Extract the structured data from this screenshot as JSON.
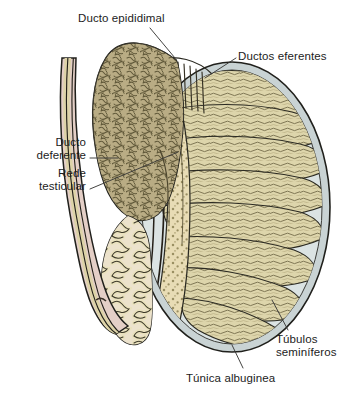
{
  "figure": {
    "width": 339,
    "height": 398,
    "background_color": "#ffffff"
  },
  "labels": [
    {
      "id": "ducto-epididimal",
      "text": "Ducto epididimal",
      "anchor": "left",
      "x": 78,
      "y": 12,
      "leader_from": [
        150,
        28
      ],
      "leader_to": [
        175,
        58
      ]
    },
    {
      "id": "ductos-eferentes",
      "text": "Ductos eferentes",
      "anchor": "left",
      "x": 238,
      "y": 50,
      "leader_from": [
        236,
        58
      ],
      "leader_to": [
        205,
        78
      ]
    },
    {
      "id": "ducto-deferente",
      "text": "Ducto\ndeferente",
      "anchor": "right",
      "x": 0,
      "y": 136,
      "leader_from": [
        90,
        158
      ],
      "leader_to": [
        118,
        158
      ]
    },
    {
      "id": "rede-testicular",
      "text": "Rede\ntesticular",
      "anchor": "right",
      "x": 0,
      "y": 167,
      "leader_from": [
        90,
        189
      ],
      "leader_to": [
        178,
        152
      ]
    },
    {
      "id": "tubulos-seminiferos",
      "text": "Túbulos\nseminíferos",
      "anchor": "left",
      "x": 276,
      "y": 333,
      "leader_from": [
        288,
        330
      ],
      "leader_to": [
        272,
        300
      ]
    },
    {
      "id": "tunica-albuginea",
      "text": "Túnica albuginea",
      "anchor": "left",
      "x": 186,
      "y": 372,
      "leader_from": [
        243,
        368
      ],
      "leader_to": [
        232,
        345
      ]
    }
  ],
  "colors": {
    "outline": "#20201c",
    "leader_line": "#3a3a38",
    "text": "#1c1c1c",
    "tunica_albuginea": "#c9d3d4",
    "tunica_albuginea_inner": "#dbe3e3",
    "seminiferous_lobule": "#ddd5ab",
    "seminiferous_strand": "#6e6644",
    "mediastinum_rete": "#e8dcb5",
    "rete_stipple": "#8a8057",
    "epididymis_body": "#b5a880",
    "epididymal_tubule": "#6a6143",
    "epididymis_sheath": "#e3d6cc",
    "ductus_deferens_wall": "#e4cfc7",
    "ductus_deferens_lumen": "#ddd3a8",
    "efferent_ductule": "#4d4734",
    "page_background": "#ffffff"
  },
  "structures": [
    {
      "id": "testis-oval",
      "name": "testis-body",
      "label_ref": "tunica-albuginea"
    },
    {
      "id": "tunica-albuginea",
      "name": "tunica-albuginea-capsule",
      "label_ref": "tunica-albuginea"
    },
    {
      "id": "seminiferous-lobules",
      "name": "seminiferous-tubule-lobules",
      "label_ref": "tubulos-seminiferos"
    },
    {
      "id": "mediastinum",
      "name": "rete-testis-mediastinum",
      "label_ref": "rede-testicular"
    },
    {
      "id": "efferent-ductules",
      "name": "efferent-ductules",
      "label_ref": "ductos-eferentes"
    },
    {
      "id": "epididymis-head",
      "name": "epididymal-duct-mass",
      "label_ref": "ducto-epididimal"
    },
    {
      "id": "epididymis-tail",
      "name": "epididymal-duct-coils",
      "label_ref": "ducto-epididimal"
    },
    {
      "id": "ductus-deferens",
      "name": "ductus-deferens-tube",
      "label_ref": "ducto-deferente"
    }
  ]
}
